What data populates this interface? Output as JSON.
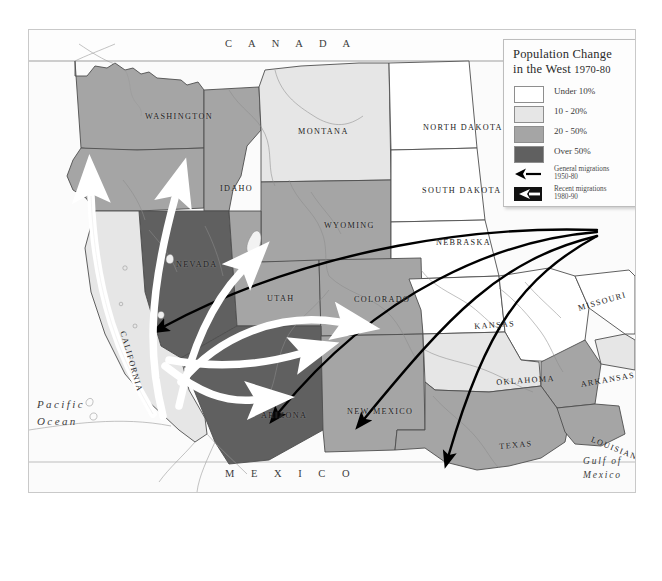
{
  "map": {
    "title_alt": "Population Change in the West 1970-80",
    "countries": [
      {
        "name": "CANADA",
        "text": "C A N A D A"
      },
      {
        "name": "MEXICO",
        "text": "M E X I C O"
      }
    ],
    "oceans": [
      {
        "name": "pacific-ocean",
        "line1": "Pacific",
        "line2": "Ocean"
      },
      {
        "name": "gulf-of-mexico",
        "line1": "Gulf of",
        "line2": "Mexico"
      }
    ],
    "states": [
      {
        "id": "washington",
        "label": "WASHINGTON",
        "x": 116,
        "y": 82,
        "rot": 0
      },
      {
        "id": "montana",
        "label": "MONTANA",
        "x": 269,
        "y": 97,
        "rot": 0
      },
      {
        "id": "north-dakota",
        "label": "NORTH DAKOTA",
        "x": 394,
        "y": 93,
        "rot": 0
      },
      {
        "id": "idaho",
        "label": "IDAHO",
        "x": 191,
        "y": 154,
        "rot": 0
      },
      {
        "id": "south-dakota",
        "label": "SOUTH DAKOTA",
        "x": 393,
        "y": 156,
        "rot": 0
      },
      {
        "id": "wyoming",
        "label": "WYOMING",
        "x": 295,
        "y": 191,
        "rot": 0
      },
      {
        "id": "nebraska",
        "label": "NEBRASKA",
        "x": 407,
        "y": 208,
        "rot": 0
      },
      {
        "id": "nevada",
        "label": "NEVADA",
        "x": 147,
        "y": 230,
        "rot": 0
      },
      {
        "id": "utah",
        "label": "UTAH",
        "x": 238,
        "y": 264,
        "rot": 0
      },
      {
        "id": "colorado",
        "label": "COLORADO",
        "x": 325,
        "y": 265,
        "rot": 0
      },
      {
        "id": "california",
        "label": "CALIFORNIA",
        "x": 98,
        "y": 300,
        "rot": 74
      },
      {
        "id": "kansas",
        "label": "KANSAS",
        "x": 445,
        "y": 292,
        "rot": -4
      },
      {
        "id": "missouri",
        "label": "MISSOURI",
        "x": 548,
        "y": 274,
        "rot": -16
      },
      {
        "id": "oklahoma",
        "label": "OKLAHOMA",
        "x": 467,
        "y": 348,
        "rot": -4
      },
      {
        "id": "arkansas",
        "label": "ARKANSAS",
        "x": 551,
        "y": 350,
        "rot": -10
      },
      {
        "id": "arizona",
        "label": "ARIZONA",
        "x": 232,
        "y": 381,
        "rot": 0
      },
      {
        "id": "new-mexico",
        "label": "NEW MEXICO",
        "x": 318,
        "y": 377,
        "rot": 0
      },
      {
        "id": "texas",
        "label": "TEXAS",
        "x": 470,
        "y": 412,
        "rot": -5
      },
      {
        "id": "louisiana",
        "label": "LOUISIANA",
        "x": 564,
        "y": 405,
        "rot": 22
      }
    ]
  },
  "legend": {
    "title_line1": "Population Change",
    "title_line2": "in the West",
    "title_years": "1970-80",
    "classes": [
      {
        "label": "Under 10%",
        "color": "#ffffff"
      },
      {
        "label": "10 - 20%",
        "color": "#e6e6e6"
      },
      {
        "label": "20 - 50%",
        "color": "#a5a5a5"
      },
      {
        "label": "Over 50%",
        "color": "#606060"
      }
    ],
    "arrows": [
      {
        "id": "general-migration",
        "line1": "General migrations",
        "line2": "1950-80",
        "style": "thin-black"
      },
      {
        "id": "recent-migration",
        "line1": "Recent migrations",
        "line2": "1980-90",
        "style": "thick-black"
      }
    ]
  },
  "chart_data": {
    "type": "map",
    "title": "Population Change in the West 1970-80",
    "legend_bins": [
      "Under 10%",
      "10 - 20%",
      "20 - 50%",
      "Over 50%"
    ],
    "bin_colors": [
      "#ffffff",
      "#e6e6e6",
      "#a5a5a5",
      "#606060"
    ],
    "state_values": [
      {
        "state": "Washington",
        "bin": "20 - 50%"
      },
      {
        "state": "Oregon",
        "bin": "20 - 50%"
      },
      {
        "state": "Idaho",
        "bin": "20 - 50%"
      },
      {
        "state": "Montana",
        "bin": "10 - 20%"
      },
      {
        "state": "Wyoming",
        "bin": "20 - 50%"
      },
      {
        "state": "Nevada",
        "bin": "Over 50%"
      },
      {
        "state": "Utah",
        "bin": "20 - 50%"
      },
      {
        "state": "Colorado",
        "bin": "20 - 50%"
      },
      {
        "state": "California",
        "bin": "10 - 20%"
      },
      {
        "state": "Arizona",
        "bin": "Over 50%"
      },
      {
        "state": "New Mexico",
        "bin": "20 - 50%"
      },
      {
        "state": "Texas",
        "bin": "20 - 50%"
      },
      {
        "state": "Oklahoma",
        "bin": "10 - 20%"
      },
      {
        "state": "Kansas",
        "bin": "Under 10%"
      },
      {
        "state": "Nebraska",
        "bin": "Under 10%"
      },
      {
        "state": "South Dakota",
        "bin": "Under 10%"
      },
      {
        "state": "North Dakota",
        "bin": "Under 10%"
      },
      {
        "state": "Missouri",
        "bin": "Under 10%"
      },
      {
        "state": "Arkansas",
        "bin": "20 - 50%"
      },
      {
        "state": "Louisiana",
        "bin": "20 - 50%"
      }
    ],
    "migration_flows": [
      {
        "type": "general",
        "from": "Midwest / East",
        "to": "Nevada"
      },
      {
        "type": "general",
        "from": "Midwest / East",
        "to": "Arizona"
      },
      {
        "type": "general",
        "from": "Midwest / East",
        "to": "New Mexico"
      },
      {
        "type": "general",
        "from": "Midwest / East",
        "to": "Texas"
      },
      {
        "type": "recent",
        "from": "California",
        "to": "Washington / Oregon"
      },
      {
        "type": "recent",
        "from": "California",
        "to": "Idaho"
      },
      {
        "type": "recent",
        "from": "California",
        "to": "Utah"
      },
      {
        "type": "recent",
        "from": "California",
        "to": "Colorado"
      },
      {
        "type": "recent",
        "from": "California",
        "to": "Arizona"
      }
    ]
  }
}
